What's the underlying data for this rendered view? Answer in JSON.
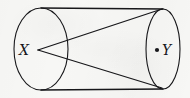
{
  "figure": {
    "name": "cylinder-with-points-x-and-y",
    "background_color": "#f7f7f5",
    "stroke_color": "#17171a",
    "canvas": {
      "width": 190,
      "height": 98
    }
  },
  "labels": {
    "x": "X",
    "y": "Y"
  },
  "points": {
    "x": {
      "label": "X",
      "cx": 38,
      "cy": 50,
      "marker": "none"
    },
    "y": {
      "label": "Y",
      "cx": 157,
      "cy": 50,
      "marker": "dot",
      "dot_radius": 2.1
    }
  },
  "shapes": {
    "left_ellipse": {
      "cx": 41,
      "cy": 49,
      "rx": 27,
      "ry": 41,
      "filled": false
    },
    "right_ellipse": {
      "cx": 163,
      "cy": 49,
      "rx": 17,
      "ry": 40,
      "filled": false
    },
    "top_edge": {
      "x1": 41,
      "y1": 8,
      "x2": 163,
      "y2": 9
    },
    "bottom_edge": {
      "x1": 41,
      "y1": 90,
      "x2": 163,
      "y2": 89
    },
    "upper_segment": {
      "x1": 38,
      "y1": 50,
      "x2": 162,
      "y2": 9
    },
    "lower_segment": {
      "x1": 38,
      "y1": 50,
      "x2": 162,
      "y2": 88
    }
  },
  "stroke_widths": {
    "ellipse": 1.1,
    "edge": 1.4,
    "segment": 1.3
  }
}
